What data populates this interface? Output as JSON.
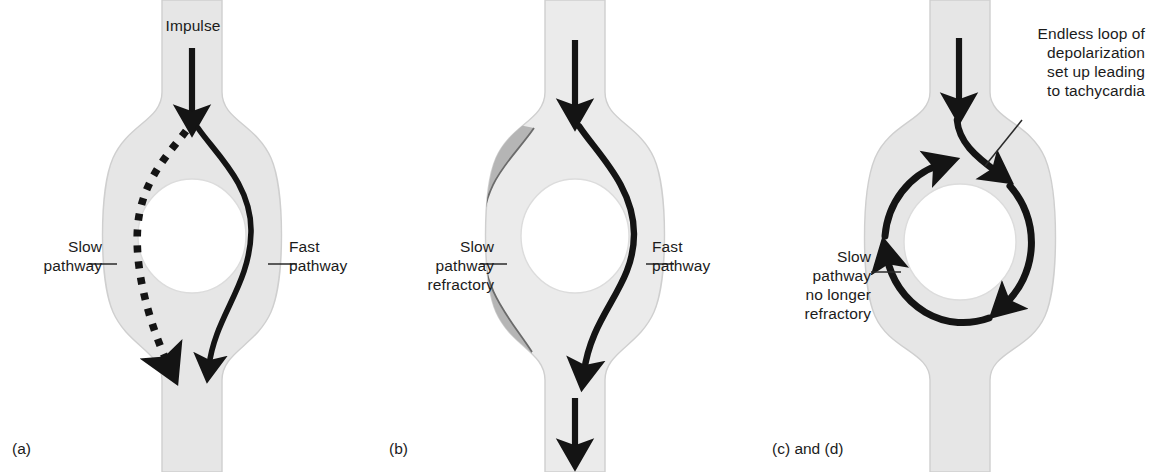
{
  "figure": {
    "width": 1151,
    "height": 472,
    "background": "#ffffff"
  },
  "colors": {
    "tissue_fill": "#e6e6e6",
    "tissue_fill_light": "#ebebeb",
    "tissue_outline": "#cfcfcf",
    "refractory_fill": "#b5b5b5",
    "refractory_outline": "#6b6b6b",
    "impulse_stroke": "#141414",
    "text": "#1b1b1b",
    "leader_line": "#2a2a2a",
    "lumen_fill": "#ffffff"
  },
  "panels": [
    {
      "id": "a",
      "caption": "(a)",
      "labels": {
        "impulse": "Impulse",
        "slow_pathway": "Slow\npathway",
        "fast_pathway": "Fast\npathway"
      },
      "pathways": {
        "slow": {
          "style": "dotted",
          "direction": "antegrade",
          "conducting": true
        },
        "fast": {
          "style": "solid",
          "direction": "antegrade",
          "conducting": true
        }
      },
      "refractory_region": false
    },
    {
      "id": "b",
      "caption": "(b)",
      "labels": {
        "slow_pathway": "Slow\npathway\nrefractory",
        "fast_pathway": "Fast\npathway"
      },
      "pathways": {
        "slow": {
          "style": "none",
          "direction": "blocked",
          "conducting": false
        },
        "fast": {
          "style": "solid",
          "direction": "antegrade",
          "conducting": true
        }
      },
      "refractory_region": true
    },
    {
      "id": "c",
      "caption": "(c) and (d)",
      "labels": {
        "slow_pathway": "Slow\npathway\nno longer\nrefractory",
        "endless_loop": "Endless loop of\ndepolarization\nset up leading\nto tachycardia"
      },
      "pathways": {
        "loop": {
          "style": "solid-circular",
          "direction": "reentrant",
          "conducting": true
        }
      },
      "refractory_region": false
    }
  ]
}
